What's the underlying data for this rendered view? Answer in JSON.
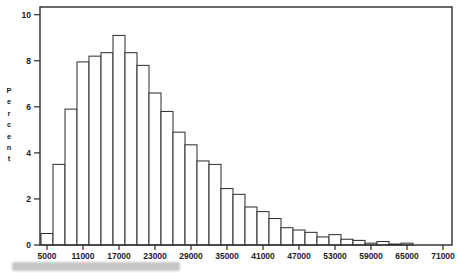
{
  "chart_data": {
    "type": "bar",
    "subtype": "histogram",
    "title": "",
    "xlabel": "",
    "ylabel": "Percent",
    "bin_width": 2000,
    "categories": [
      5000,
      7000,
      9000,
      11000,
      13000,
      15000,
      17000,
      19000,
      21000,
      23000,
      25000,
      27000,
      29000,
      31000,
      33000,
      35000,
      37000,
      39000,
      41000,
      43000,
      45000,
      47000,
      49000,
      51000,
      53000,
      55000,
      57000,
      59000,
      61000,
      63000,
      65000,
      67000,
      69000,
      71000
    ],
    "values": [
      0.5,
      3.5,
      5.9,
      7.95,
      8.2,
      8.35,
      9.1,
      8.35,
      7.8,
      6.6,
      5.8,
      4.9,
      4.35,
      3.65,
      3.5,
      2.45,
      2.2,
      1.65,
      1.45,
      1.15,
      0.75,
      0.65,
      0.55,
      0.35,
      0.45,
      0.25,
      0.2,
      0.08,
      0.15,
      0.04,
      0.08,
      0,
      0,
      0
    ],
    "x_tick_labels": [
      "5000",
      "11000",
      "17000",
      "23000",
      "29000",
      "35000",
      "41000",
      "47000",
      "53000",
      "59000",
      "65000",
      "71000"
    ],
    "y_tick_labels": [
      "0",
      "2",
      "4",
      "6",
      "8",
      "10"
    ],
    "y_ticks": [
      0,
      2,
      4,
      6,
      8,
      10
    ],
    "ylim": [
      0,
      10
    ],
    "xlim": [
      4000,
      72000
    ],
    "grid": "off",
    "legend": "none",
    "colors": {
      "background": "#ffffff",
      "bar_fill": "#ffffff",
      "bar_stroke": "#2b2b2b",
      "axis": "#2b2b2b",
      "text": "#1c1c1c",
      "blur_strip": "#c6c6c6"
    }
  },
  "decorations": {
    "blurred_caption_present": true
  }
}
